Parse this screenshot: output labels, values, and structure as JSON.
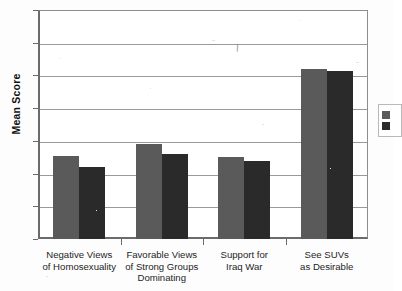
{
  "chart_data": {
    "type": "bar",
    "title": "",
    "subtitle": "",
    "xlabel": "",
    "ylabel": "Mean Score",
    "ylim": [
      0,
      7
    ],
    "yticks": [
      0,
      1,
      2,
      3,
      4,
      5,
      6,
      7
    ],
    "ytick_labels": [
      "0",
      "1",
      "2",
      "3",
      "4",
      "5",
      "6",
      "7"
    ],
    "grid": true,
    "grid_axis": "y",
    "legend_position": "right-outside-clipped",
    "categories": [
      "Negative Views of Homosexuality",
      "Favorable Views of Strong Groups Dominating",
      "Support for Iraq War",
      "See SUVs as Desirable"
    ],
    "category_label_lines": [
      [
        "Negative Views",
        "of Homosexuality"
      ],
      [
        "Favorable Views",
        "of Strong Groups",
        "Dominating"
      ],
      [
        "Support for",
        "Iraq War"
      ],
      [
        "See SUVs",
        "as Desirable"
      ]
    ],
    "series": [
      {
        "name": "",
        "color": "#5a5a5a",
        "values": [
          2.55,
          2.9,
          2.5,
          5.2
        ]
      },
      {
        "name": "",
        "color": "#2a2a2a",
        "values": [
          2.2,
          2.6,
          2.4,
          5.15
        ]
      }
    ]
  },
  "legend": {
    "rows": [
      {
        "label": ""
      },
      {
        "label": ""
      }
    ]
  },
  "artifact": {
    "mark": "\\"
  }
}
